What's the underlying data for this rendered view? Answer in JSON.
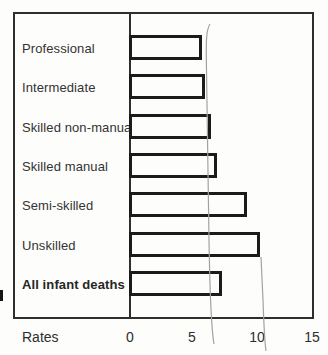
{
  "chart_data": {
    "type": "bar",
    "orientation": "horizontal",
    "title": "",
    "xlabel": "Rates",
    "ylabel": "",
    "categories": [
      "Professional",
      "Intermediate",
      "Skilled non-manual",
      "Skilled manual",
      "Semi-skilled",
      "Unskilled",
      "All infant deaths"
    ],
    "values": [
      6.0,
      6.2,
      6.7,
      7.2,
      9.7,
      10.7,
      7.6
    ],
    "x_ticks": [
      "0",
      "5",
      "10",
      "15"
    ],
    "xlim": [
      0,
      15
    ],
    "emphasis_category": "All infant deaths",
    "grid": false,
    "legend": null,
    "bar_fill": "#ffffff",
    "bar_outline": "#1b1b1b",
    "frame_color": "#2e2e2e",
    "pen_mark_color": "#a3a39e",
    "hand_drawn_marks": [
      {
        "name": "pen-line-left",
        "approx_value": 6.4,
        "note": "thin pen line from top of Professional bar down past axis"
      },
      {
        "name": "pen-line-right",
        "approx_value": 10.9,
        "note": "thin pen line from Unskilled bar corner down past axis"
      }
    ]
  }
}
